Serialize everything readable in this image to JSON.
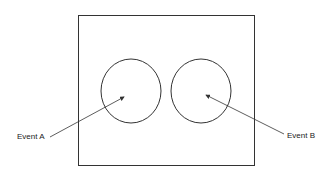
{
  "diagram": {
    "type": "venn",
    "sample_space": {
      "x": 78,
      "y": 15,
      "width": 176,
      "height": 150
    },
    "events": [
      {
        "label": "Event A",
        "cx": 131,
        "cy": 91,
        "rx": 30,
        "ry": 32
      },
      {
        "label": "Event B",
        "cx": 201,
        "cy": 91,
        "rx": 30,
        "ry": 32
      }
    ],
    "colors": {
      "line": "#333333",
      "background": "#ffffff"
    }
  }
}
